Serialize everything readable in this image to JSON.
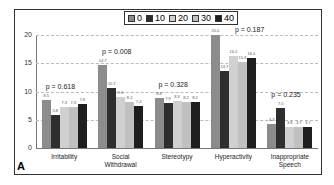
{
  "chart_data": {
    "type": "bar",
    "title": "",
    "xlabel": "",
    "ylabel": "",
    "ylim": [
      0,
      20
    ],
    "yticks": [
      0,
      5,
      10,
      15,
      20
    ],
    "grid": true,
    "legend_position": "top-center",
    "panel_label": "A",
    "categories": [
      "Irritability",
      "Social Withdrawal",
      "Stereotypy",
      "Hyperactivity",
      "Inappropriate Speech"
    ],
    "category_lines": [
      [
        "Irritability"
      ],
      [
        "Social",
        "Withdrawal"
      ],
      [
        "Stereotypy"
      ],
      [
        "Hyperactivity"
      ],
      [
        "Inappropriate",
        "Speech"
      ]
    ],
    "series": [
      {
        "name": "0",
        "color": "#8c8c8c",
        "values": [
          8.5,
          14.7,
          8.8,
          20.0,
          4.3
        ]
      },
      {
        "name": "10",
        "color": "#2e2e2e",
        "values": [
          5.8,
          10.7,
          7.9,
          13.7,
          7.0
        ]
      },
      {
        "name": "20",
        "color": "#d0d0d0",
        "values": [
          7.3,
          9.0,
          8.3,
          16.2,
          3.8
        ]
      },
      {
        "name": "30",
        "color": "#c0c0c0",
        "values": [
          7.3,
          8.2,
          8.2,
          15.3,
          3.7
        ]
      },
      {
        "name": "40",
        "color": "#1e1e1e",
        "values": [
          7.8,
          7.4,
          8.2,
          16.0,
          3.7
        ]
      }
    ],
    "annotations": [
      "p = 0.618",
      "p = 0.008",
      "p = 0.328",
      "p = 0.187",
      "p = 0.235"
    ]
  }
}
